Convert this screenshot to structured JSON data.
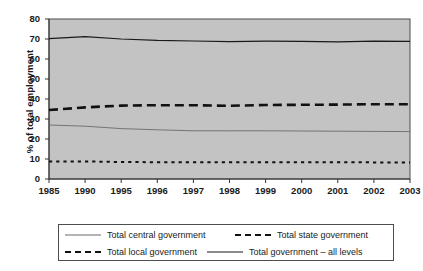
{
  "chart_data": {
    "type": "line",
    "title": "",
    "xlabel": "",
    "ylabel": "% of total employment",
    "ylim": [
      0,
      80
    ],
    "ytick_step": 10,
    "yticks": [
      "0",
      "10",
      "20",
      "30",
      "40",
      "50",
      "60",
      "70",
      "80"
    ],
    "grid": false,
    "legend_position": "bottom",
    "plot_background": "#c3c3c3",
    "categories": [
      "1985",
      "1990",
      "1995",
      "1996",
      "1997",
      "1998",
      "1999",
      "2000",
      "2001",
      "2002",
      "2003"
    ],
    "series": [
      {
        "name": "Total government – all levels",
        "style": "solid-thin-dark",
        "color": "#1a1a1a",
        "values": [
          70.2,
          71.2,
          70.0,
          69.3,
          69.0,
          68.7,
          68.9,
          68.8,
          68.6,
          68.9,
          68.8
        ]
      },
      {
        "name": "Total local government",
        "style": "dashed-thick",
        "color": "#111111",
        "values": [
          34.5,
          35.8,
          36.7,
          36.9,
          36.9,
          36.6,
          37.0,
          37.1,
          37.2,
          37.4,
          37.4
        ]
      },
      {
        "name": "Total central government",
        "style": "solid-thin-gray",
        "color": "#6b6b6b",
        "values": [
          27.0,
          26.4,
          25.2,
          24.6,
          24.1,
          24.1,
          24.1,
          24.0,
          23.9,
          23.8,
          23.7
        ]
      },
      {
        "name": "Total state government",
        "style": "dotted",
        "color": "#111111",
        "values": [
          8.8,
          8.8,
          8.5,
          8.4,
          8.4,
          8.4,
          8.4,
          8.4,
          8.4,
          8.3,
          8.3
        ]
      }
    ]
  },
  "legend": {
    "entries": [
      {
        "label": "Total central government",
        "style": "sw-thin"
      },
      {
        "label": "Total state government",
        "style": "sw-dotted"
      },
      {
        "label": "Total local government",
        "style": "sw-dashed"
      },
      {
        "label": "Total  government – all levels",
        "style": "sw-thin2"
      }
    ]
  }
}
